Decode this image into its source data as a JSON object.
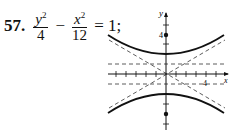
{
  "problem": {
    "number": "57.",
    "term1_num": "y",
    "term1_den": "4",
    "minus": "−",
    "term2_num": "x",
    "term2_den": "12",
    "exp": "2",
    "rhs": "= 1;"
  },
  "graph": {
    "y_axis_label": "y",
    "x_axis_label": "x",
    "y_tick_label": "4",
    "x_tick_label": "4",
    "foci": [
      [
        0,
        4
      ],
      [
        0,
        -4
      ]
    ],
    "vertices": [
      [
        0,
        2
      ],
      [
        0,
        -2
      ]
    ],
    "asymptotes": [
      "y = x/√3",
      "y = -x/√3"
    ],
    "dashed_horizontal": [
      2,
      -2
    ]
  }
}
